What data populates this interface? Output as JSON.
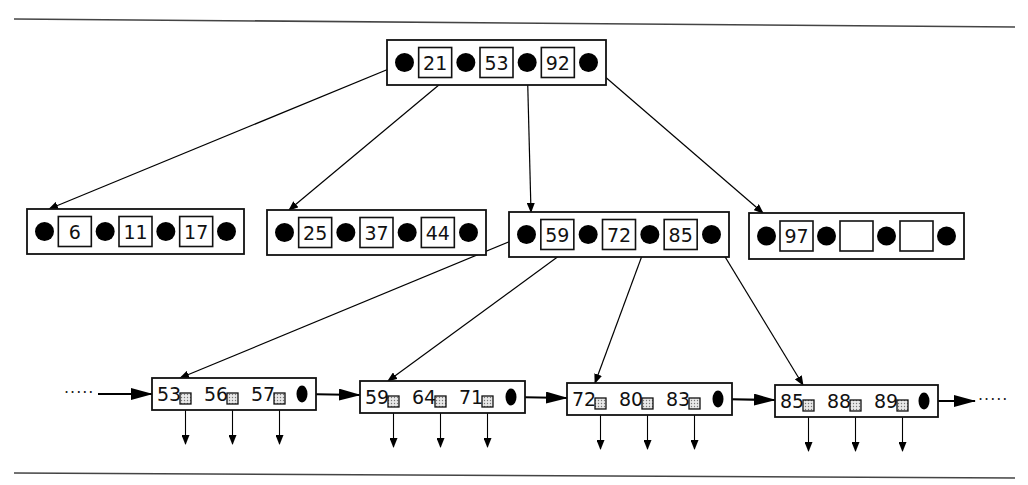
{
  "diagram": {
    "type": "b-plus-tree",
    "colors": {
      "stroke": "#111111",
      "pointer": "#000000",
      "record_fill": "#d8d8d8",
      "background": "#ffffff"
    },
    "root": {
      "keys": [
        "21",
        "53",
        "92"
      ],
      "x": 387,
      "y": 40,
      "w": 219,
      "h": 45
    },
    "internal": [
      {
        "keys": [
          "6",
          "11",
          "17"
        ],
        "x": 27,
        "y": 209,
        "w": 217,
        "h": 45
      },
      {
        "keys": [
          "25",
          "37",
          "44"
        ],
        "x": 267,
        "y": 210,
        "w": 219,
        "h": 45
      },
      {
        "keys": [
          "59",
          "72",
          "85"
        ],
        "x": 509,
        "y": 212,
        "w": 220,
        "h": 45
      },
      {
        "keys": [
          "97",
          "",
          ""
        ],
        "x": 749,
        "y": 213,
        "w": 215,
        "h": 46
      }
    ],
    "leaves": [
      {
        "keys": [
          "53",
          "56",
          "57"
        ],
        "x": 152,
        "y": 378,
        "w": 164,
        "h": 32
      },
      {
        "keys": [
          "59",
          "64",
          "71"
        ],
        "x": 360,
        "y": 381,
        "w": 165,
        "h": 32
      },
      {
        "keys": [
          "72",
          "80",
          "83"
        ],
        "x": 567,
        "y": 383,
        "w": 165,
        "h": 32
      },
      {
        "keys": [
          "85",
          "88",
          "89"
        ],
        "x": 775,
        "y": 385,
        "w": 163,
        "h": 32
      }
    ],
    "leaf_chain": {
      "left_continuation": "·····",
      "right_continuation": "·····"
    },
    "rules": {
      "top": {
        "x1": 14,
        "y1": 19,
        "x2": 1015,
        "y2": 27
      },
      "bottom": {
        "x1": 14,
        "y1": 473,
        "x2": 1015,
        "y2": 478
      }
    }
  }
}
